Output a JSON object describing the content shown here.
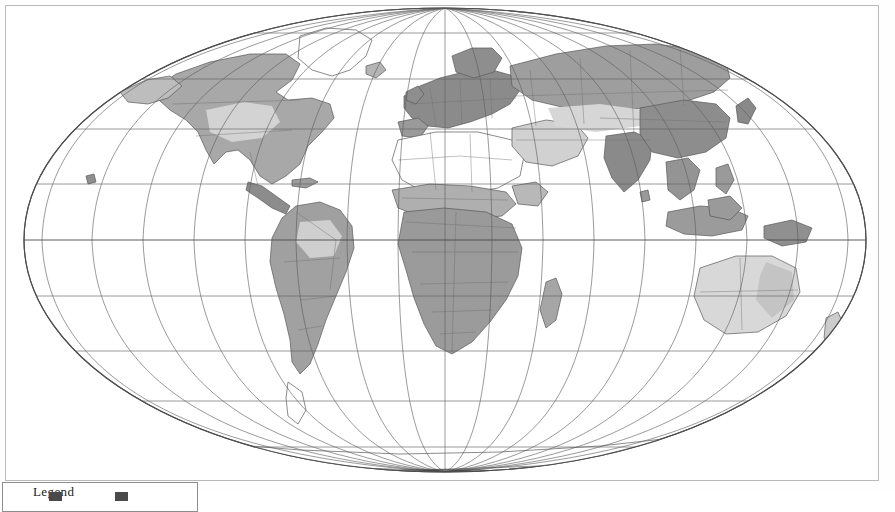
{
  "figure": {
    "kind": "world-map",
    "projection": "Mollweide (pseudocylindrical equal-area)",
    "central_meridian": 0,
    "background_color": "#ffffff",
    "frame_color": "#b9b9b9"
  },
  "graticule": {
    "label": "latitude-longitude grid",
    "meridian_interval_degrees": 20,
    "parallel_interval_degrees": 20,
    "meridians": [
      -180,
      -160,
      -140,
      -120,
      -100,
      -80,
      -60,
      -40,
      -20,
      0,
      20,
      40,
      60,
      80,
      100,
      120,
      140,
      160,
      180
    ],
    "parallels": [
      -80,
      -60,
      -40,
      -20,
      0,
      20,
      40,
      60,
      80
    ],
    "line_color": "#5d5d5d",
    "equator_color": "#4a4a4a"
  },
  "map": {
    "outline_color": "#565656",
    "border_color": "#7a7a7a",
    "ocean_color": "#ffffff",
    "shading_note": "grayscale choropleth, darker = higher value"
  },
  "shading_classes": [
    {
      "name": "class-very-high",
      "color": "#8e8e8e"
    },
    {
      "name": "class-high",
      "color": "#a5a5a5"
    },
    {
      "name": "class-medium",
      "color": "#bdbdbd"
    },
    {
      "name": "class-low",
      "color": "#d6d6d6"
    },
    {
      "name": "class-none",
      "color": "#ffffff"
    }
  ],
  "regions": [
    {
      "name": "North America",
      "shade": "class-high"
    },
    {
      "name": "Central America",
      "shade": "class-very-high"
    },
    {
      "name": "South America",
      "shade": "class-high"
    },
    {
      "name": "Europe",
      "shade": "class-very-high"
    },
    {
      "name": "North Africa",
      "shade": "class-none"
    },
    {
      "name": "Sub-Saharan Africa",
      "shade": "class-high"
    },
    {
      "name": "Middle East",
      "shade": "class-low"
    },
    {
      "name": "Russia / North Asia",
      "shade": "class-high"
    },
    {
      "name": "India",
      "shade": "class-very-high"
    },
    {
      "name": "East Asia",
      "shade": "class-very-high"
    },
    {
      "name": "Southeast Asia",
      "shade": "class-high"
    },
    {
      "name": "Australia",
      "shade": "class-low"
    },
    {
      "name": "New Zealand",
      "shade": "class-low"
    },
    {
      "name": "Greenland",
      "shade": "class-none"
    },
    {
      "name": "Antarctica",
      "shade": "class-none"
    }
  ],
  "legend": {
    "title": "Legend",
    "visible": "partially clipped at page bottom",
    "border_color": "#8d8d8d",
    "items": [
      {
        "label": "",
        "swatch": "#4a4a4a"
      },
      {
        "label": "",
        "swatch": "#4a4a4a"
      }
    ]
  }
}
